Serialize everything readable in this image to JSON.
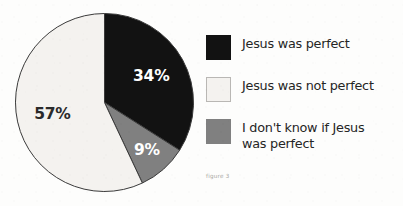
{
  "chart_data": {
    "type": "pie",
    "title": "",
    "caption": "figure 3",
    "categories": [
      "Jesus was perfect",
      "Jesus was not perfect",
      "I don't know if Jesus was perfect"
    ],
    "values": [
      34,
      9,
      57
    ],
    "value_labels": [
      "34%",
      "9%",
      "57%"
    ],
    "unit": "%",
    "start_angle_deg": 0,
    "direction": "clockwise",
    "legend_position": "right",
    "grid": false,
    "slices": [
      {
        "label": "Jesus was perfect",
        "value": 34,
        "value_label": "34%",
        "color": "#121212",
        "label_color": "#ffffff",
        "start_deg": 0,
        "end_deg": 122.4
      },
      {
        "label": "I don't know if Jesus was perfect",
        "value": 9,
        "value_label": "9%",
        "color": "#808080",
        "label_color": "#ffffff",
        "start_deg": 122.4,
        "end_deg": 154.8
      },
      {
        "label": "Jesus was not perfect",
        "value": 57,
        "value_label": "57%",
        "color": "#f4f2ef",
        "label_color": "#2a2a2a",
        "start_deg": 154.8,
        "end_deg": 360
      }
    ]
  },
  "legend": {
    "items": [
      {
        "label": "Jesus was perfect",
        "swatch": "black"
      },
      {
        "label": "Jesus was not perfect",
        "swatch": "white"
      },
      {
        "label": "I don't know if Jesus\nwas perfect",
        "swatch": "gray"
      }
    ]
  },
  "caption": {
    "text": "figure 3"
  },
  "colors": {
    "black_slice": "#121212",
    "gray_slice": "#808080",
    "white_slice": "#f4f2ef",
    "outline": "#3a3a3a",
    "background": "#fdfdfc",
    "caption_text": "#a7a5a2"
  }
}
